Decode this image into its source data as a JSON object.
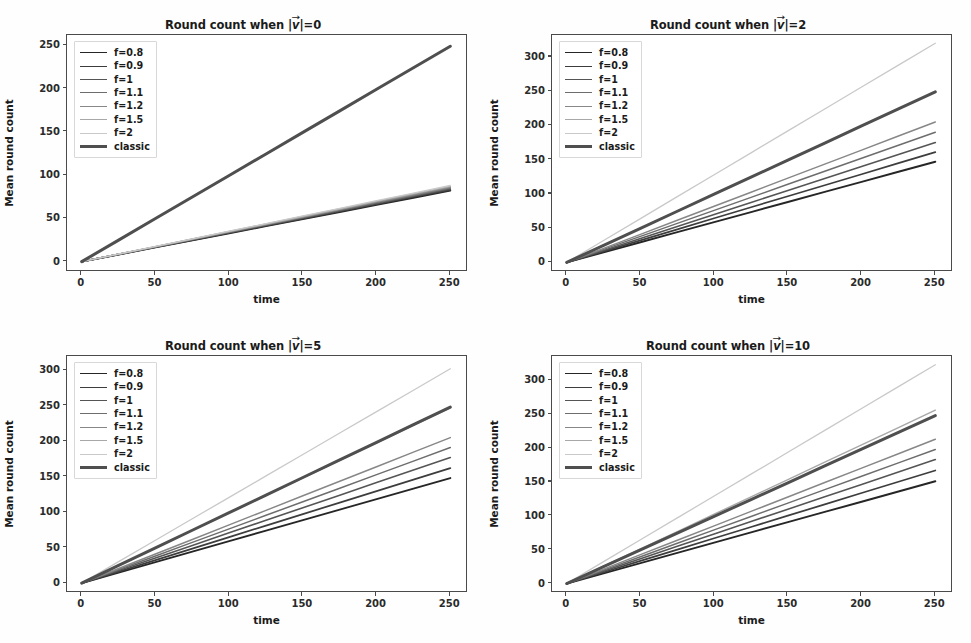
{
  "figure": {
    "background_color": "#fefefe",
    "axes_color": "#4a4a4a",
    "text_color": "#1b1b1b",
    "series_colors": [
      "#262626",
      "#3d3d3d",
      "#555555",
      "#6d6d6d",
      "#878787",
      "#a8a8a8",
      "#c9c9c9",
      "#4f4f4f"
    ],
    "classic_color": "#4f4f4f"
  },
  "labels": {
    "xlabel": "time",
    "ylabel": "Mean round count",
    "legend_entries": [
      "f=0.8",
      "f=0.9",
      "f=1",
      "f=1.1",
      "f=1.2",
      "f=1.5",
      "f=2",
      "classic"
    ]
  },
  "chart_data": [
    {
      "type": "line",
      "title": "Round count when |v⃗|=0",
      "title_prefix": "Round count when |",
      "title_symbol": "v",
      "title_suffix": "|=0",
      "xlabel": "time",
      "ylabel": "Mean round count",
      "xlim": [
        -10,
        262
      ],
      "ylim": [
        -12,
        262
      ],
      "xticks": [
        0,
        50,
        100,
        150,
        200,
        250
      ],
      "yticks": [
        0,
        50,
        100,
        150,
        200,
        250
      ],
      "grid": false,
      "legend_position": "upper left",
      "x": [
        0,
        25,
        50,
        75,
        100,
        125,
        150,
        175,
        200,
        225,
        250
      ],
      "series": [
        {
          "name": "f=0.8",
          "values": [
            0,
            8.2,
            16.4,
            24.6,
            32.8,
            41.0,
            49.2,
            57.4,
            65.6,
            73.8,
            82.0
          ]
        },
        {
          "name": "f=0.9",
          "values": [
            0,
            8.3,
            16.6,
            24.9,
            33.2,
            41.5,
            49.8,
            58.1,
            66.4,
            74.7,
            83.0
          ]
        },
        {
          "name": "f=1",
          "values": [
            0,
            8.4,
            16.8,
            25.2,
            33.6,
            42.0,
            50.4,
            58.8,
            67.2,
            75.6,
            84.0
          ]
        },
        {
          "name": "f=1.1",
          "values": [
            0,
            8.5,
            17.0,
            25.5,
            34.0,
            42.5,
            51.0,
            59.5,
            68.0,
            76.5,
            85.0
          ]
        },
        {
          "name": "f=1.2",
          "values": [
            0,
            8.6,
            17.2,
            25.8,
            34.4,
            43.0,
            51.6,
            60.2,
            68.8,
            77.4,
            86.0
          ]
        },
        {
          "name": "f=1.5",
          "values": [
            0,
            8.7,
            17.4,
            26.1,
            34.8,
            43.5,
            52.2,
            60.9,
            69.6,
            78.3,
            87.0
          ]
        },
        {
          "name": "f=2",
          "values": [
            0,
            8.8,
            17.6,
            26.4,
            35.2,
            44.0,
            52.8,
            61.6,
            70.4,
            79.2,
            88.0
          ]
        },
        {
          "name": "classic",
          "values": [
            0,
            24.9,
            49.8,
            74.7,
            99.6,
            124.5,
            149.4,
            174.3,
            199.2,
            224.1,
            249.0
          ]
        }
      ]
    },
    {
      "type": "line",
      "title": "Round count when |v⃗|=2",
      "title_prefix": "Round count when |",
      "title_symbol": "v",
      "title_suffix": "|=2",
      "xlabel": "time",
      "ylabel": "Mean round count",
      "xlim": [
        -10,
        262
      ],
      "ylim": [
        -14,
        332
      ],
      "xticks": [
        0,
        50,
        100,
        150,
        200,
        250
      ],
      "yticks": [
        0,
        50,
        100,
        150,
        200,
        250,
        300
      ],
      "grid": false,
      "legend_position": "upper left",
      "x": [
        0,
        25,
        50,
        75,
        100,
        125,
        150,
        175,
        200,
        225,
        250
      ],
      "series": [
        {
          "name": "f=0.8",
          "values": [
            0,
            14.7,
            29.4,
            44.1,
            58.8,
            73.5,
            88.2,
            102.9,
            117.6,
            132.3,
            147.0
          ]
        },
        {
          "name": "f=0.9",
          "values": [
            0,
            16.1,
            32.2,
            48.3,
            64.4,
            80.5,
            96.6,
            112.7,
            128.8,
            144.9,
            161.0
          ]
        },
        {
          "name": "f=1",
          "values": [
            0,
            17.5,
            35.0,
            52.5,
            70.0,
            87.5,
            105.0,
            122.5,
            140.0,
            157.5,
            175.0
          ]
        },
        {
          "name": "f=1.1",
          "values": [
            0,
            19.0,
            38.0,
            57.0,
            76.0,
            95.0,
            114.0,
            133.0,
            152.0,
            171.0,
            190.0
          ]
        },
        {
          "name": "f=1.2",
          "values": [
            0,
            20.5,
            41.0,
            61.5,
            82.0,
            102.5,
            123.0,
            143.5,
            164.0,
            184.5,
            205.0
          ]
        },
        {
          "name": "f=1.5",
          "values": [
            0,
            24.9,
            49.8,
            74.7,
            99.6,
            124.5,
            149.4,
            174.3,
            199.2,
            224.1,
            249.0
          ]
        },
        {
          "name": "f=2",
          "values": [
            0,
            32.0,
            64.0,
            96.0,
            128.0,
            160.0,
            192.0,
            224.0,
            256.0,
            288.0,
            320.0
          ]
        },
        {
          "name": "classic",
          "values": [
            0,
            24.9,
            49.8,
            74.7,
            99.6,
            124.5,
            149.4,
            174.3,
            199.2,
            224.1,
            249.0
          ]
        }
      ]
    },
    {
      "type": "line",
      "title": "Round count when |v⃗|=5",
      "title_prefix": "Round count when |",
      "title_symbol": "v",
      "title_suffix": "|=5",
      "xlabel": "time",
      "ylabel": "Mean round count",
      "xlim": [
        -10,
        262
      ],
      "ylim": [
        -14,
        320
      ],
      "xticks": [
        0,
        50,
        100,
        150,
        200,
        250
      ],
      "yticks": [
        0,
        50,
        100,
        150,
        200,
        250,
        300
      ],
      "grid": false,
      "legend_position": "upper left",
      "x": [
        0,
        25,
        50,
        75,
        100,
        125,
        150,
        175,
        200,
        225,
        250
      ],
      "series": [
        {
          "name": "f=0.8",
          "values": [
            0,
            14.8,
            29.6,
            44.4,
            59.2,
            74.0,
            88.8,
            103.6,
            118.4,
            133.2,
            148.0
          ]
        },
        {
          "name": "f=0.9",
          "values": [
            0,
            16.2,
            32.4,
            48.6,
            64.8,
            81.0,
            97.2,
            113.4,
            129.6,
            145.8,
            162.0
          ]
        },
        {
          "name": "f=1",
          "values": [
            0,
            17.7,
            35.4,
            53.1,
            70.8,
            88.5,
            106.2,
            123.9,
            141.6,
            159.3,
            177.0
          ]
        },
        {
          "name": "f=1.1",
          "values": [
            0,
            19.1,
            38.2,
            57.3,
            76.4,
            95.5,
            114.6,
            133.7,
            152.8,
            171.9,
            191.0
          ]
        },
        {
          "name": "f=1.2",
          "values": [
            0,
            20.5,
            41.0,
            61.5,
            82.0,
            102.5,
            123.0,
            143.5,
            164.0,
            184.5,
            205.0
          ]
        },
        {
          "name": "f=1.5",
          "values": [
            0,
            24.7,
            49.4,
            74.1,
            98.8,
            123.5,
            148.2,
            172.9,
            197.6,
            222.3,
            247.0
          ]
        },
        {
          "name": "f=2",
          "values": [
            0,
            30.2,
            60.4,
            90.6,
            120.8,
            151.0,
            181.2,
            211.4,
            241.6,
            271.8,
            302.0
          ]
        },
        {
          "name": "classic",
          "values": [
            0,
            24.8,
            49.6,
            74.4,
            99.2,
            124.0,
            148.8,
            173.6,
            198.4,
            223.2,
            248.0
          ]
        }
      ]
    },
    {
      "type": "line",
      "title": "Round count when |v⃗|=10",
      "title_prefix": "Round count when |",
      "title_symbol": "v",
      "title_suffix": "|=10",
      "xlabel": "time",
      "ylabel": "Mean round count",
      "xlim": [
        -10,
        262
      ],
      "ylim": [
        -14,
        336
      ],
      "xticks": [
        0,
        50,
        100,
        150,
        200,
        250
      ],
      "yticks": [
        0,
        50,
        100,
        150,
        200,
        250,
        300
      ],
      "grid": false,
      "legend_position": "upper left",
      "x": [
        0,
        25,
        50,
        75,
        100,
        125,
        150,
        175,
        200,
        225,
        250
      ],
      "series": [
        {
          "name": "f=0.8",
          "values": [
            0,
            15.1,
            30.2,
            45.3,
            60.4,
            75.5,
            90.6,
            105.7,
            120.8,
            135.9,
            151.0
          ]
        },
        {
          "name": "f=0.9",
          "values": [
            0,
            16.7,
            33.4,
            50.1,
            66.8,
            83.5,
            100.2,
            116.9,
            133.6,
            150.3,
            167.0
          ]
        },
        {
          "name": "f=1",
          "values": [
            0,
            18.3,
            36.6,
            54.9,
            73.2,
            91.5,
            109.8,
            128.1,
            146.4,
            164.7,
            183.0
          ]
        },
        {
          "name": "f=1.1",
          "values": [
            0,
            19.8,
            39.6,
            59.4,
            79.2,
            99.0,
            118.8,
            138.6,
            158.4,
            178.2,
            198.0
          ]
        },
        {
          "name": "f=1.2",
          "values": [
            0,
            21.3,
            42.6,
            63.9,
            85.2,
            106.5,
            127.8,
            149.1,
            170.4,
            191.7,
            213.0
          ]
        },
        {
          "name": "f=1.5",
          "values": [
            0,
            25.6,
            51.2,
            76.8,
            102.4,
            128.0,
            153.6,
            179.2,
            204.8,
            230.4,
            256.0
          ]
        },
        {
          "name": "f=2",
          "values": [
            0,
            32.3,
            64.6,
            96.9,
            129.2,
            161.5,
            193.8,
            226.1,
            258.4,
            290.7,
            323.0
          ]
        },
        {
          "name": "classic",
          "values": [
            0,
            24.8,
            49.6,
            74.4,
            99.2,
            124.0,
            148.8,
            173.6,
            198.4,
            223.2,
            248.0
          ]
        }
      ]
    }
  ],
  "panels_geometry": [
    {
      "left": 0,
      "top": 0,
      "width": 486,
      "height": 322
    },
    {
      "left": 485,
      "top": 0,
      "width": 486,
      "height": 322
    },
    {
      "left": 0,
      "top": 321,
      "width": 486,
      "height": 322
    },
    {
      "left": 485,
      "top": 321,
      "width": 486,
      "height": 322
    }
  ]
}
